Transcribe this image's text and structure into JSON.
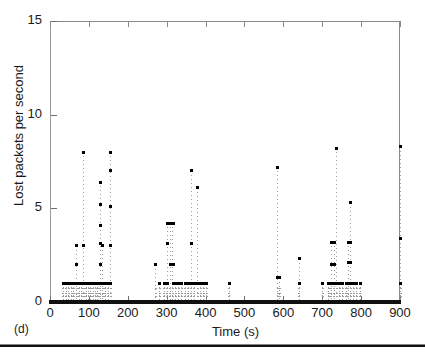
{
  "figure": {
    "subfigure_label": "(d)"
  },
  "chart_data": {
    "type": "scatter",
    "title": "",
    "xlabel": "Time (s)",
    "ylabel": "Lost packets per second",
    "xlim": [
      0,
      900
    ],
    "ylim": [
      0,
      15
    ],
    "xticks": [
      0,
      100,
      200,
      300,
      400,
      500,
      600,
      700,
      800,
      900
    ],
    "yticks": [
      0,
      5,
      10,
      15
    ],
    "xtick_labels": [
      "0",
      "100",
      "200",
      "300",
      "400",
      "500",
      "600",
      "700",
      "800",
      "900"
    ],
    "ytick_labels": [
      "0",
      "5",
      "10",
      "15"
    ],
    "grid": false,
    "legend": null,
    "marker": "square-dot",
    "marker_color": "#000000",
    "stem_color": "#9c9c9c",
    "points": [
      {
        "x": 33,
        "y": 1
      },
      {
        "x": 40,
        "y": 1
      },
      {
        "x": 47,
        "y": 1
      },
      {
        "x": 54,
        "y": 1
      },
      {
        "x": 60,
        "y": 1
      },
      {
        "x": 67,
        "y": 1
      },
      {
        "x": 67,
        "y": 2
      },
      {
        "x": 67,
        "y": 3
      },
      {
        "x": 74,
        "y": 1
      },
      {
        "x": 80,
        "y": 1
      },
      {
        "x": 86,
        "y": 8
      },
      {
        "x": 86,
        "y": 3
      },
      {
        "x": 86,
        "y": 1
      },
      {
        "x": 92,
        "y": 1
      },
      {
        "x": 98,
        "y": 1
      },
      {
        "x": 104,
        "y": 1
      },
      {
        "x": 110,
        "y": 1
      },
      {
        "x": 116,
        "y": 1
      },
      {
        "x": 122,
        "y": 1
      },
      {
        "x": 128,
        "y": 6.4
      },
      {
        "x": 128,
        "y": 5.2
      },
      {
        "x": 128,
        "y": 4.1
      },
      {
        "x": 128,
        "y": 3.1
      },
      {
        "x": 128,
        "y": 2
      },
      {
        "x": 128,
        "y": 1
      },
      {
        "x": 134,
        "y": 3
      },
      {
        "x": 134,
        "y": 1
      },
      {
        "x": 141,
        "y": 1
      },
      {
        "x": 148,
        "y": 1
      },
      {
        "x": 155,
        "y": 8
      },
      {
        "x": 155,
        "y": 7
      },
      {
        "x": 155,
        "y": 5.1
      },
      {
        "x": 155,
        "y": 3
      },
      {
        "x": 155,
        "y": 1
      },
      {
        "x": 271,
        "y": 2
      },
      {
        "x": 281,
        "y": 1
      },
      {
        "x": 292,
        "y": 1
      },
      {
        "x": 300,
        "y": 4.2
      },
      {
        "x": 300,
        "y": 3.1
      },
      {
        "x": 300,
        "y": 1
      },
      {
        "x": 308,
        "y": 4.2
      },
      {
        "x": 308,
        "y": 2
      },
      {
        "x": 315,
        "y": 4.2
      },
      {
        "x": 315,
        "y": 2
      },
      {
        "x": 315,
        "y": 1
      },
      {
        "x": 322,
        "y": 1
      },
      {
        "x": 330,
        "y": 1
      },
      {
        "x": 338,
        "y": 1
      },
      {
        "x": 346,
        "y": 1
      },
      {
        "x": 354,
        "y": 1
      },
      {
        "x": 362,
        "y": 7
      },
      {
        "x": 362,
        "y": 3.1
      },
      {
        "x": 362,
        "y": 1
      },
      {
        "x": 370,
        "y": 1
      },
      {
        "x": 378,
        "y": 6.1
      },
      {
        "x": 378,
        "y": 1
      },
      {
        "x": 386,
        "y": 1
      },
      {
        "x": 394,
        "y": 1
      },
      {
        "x": 402,
        "y": 1
      },
      {
        "x": 460,
        "y": 1
      },
      {
        "x": 584,
        "y": 7.2
      },
      {
        "x": 584,
        "y": 1.3
      },
      {
        "x": 590,
        "y": 1.3
      },
      {
        "x": 640,
        "y": 2.3
      },
      {
        "x": 640,
        "y": 1
      },
      {
        "x": 700,
        "y": 1
      },
      {
        "x": 716,
        "y": 1
      },
      {
        "x": 722,
        "y": 3.2
      },
      {
        "x": 722,
        "y": 2
      },
      {
        "x": 722,
        "y": 1
      },
      {
        "x": 729,
        "y": 3.2
      },
      {
        "x": 729,
        "y": 2
      },
      {
        "x": 729,
        "y": 1
      },
      {
        "x": 736,
        "y": 8.2
      },
      {
        "x": 736,
        "y": 1
      },
      {
        "x": 744,
        "y": 1
      },
      {
        "x": 752,
        "y": 1
      },
      {
        "x": 760,
        "y": 1
      },
      {
        "x": 766,
        "y": 3.2
      },
      {
        "x": 766,
        "y": 2.1
      },
      {
        "x": 766,
        "y": 1
      },
      {
        "x": 772,
        "y": 5.3
      },
      {
        "x": 772,
        "y": 3.2
      },
      {
        "x": 772,
        "y": 2.1
      },
      {
        "x": 772,
        "y": 1
      },
      {
        "x": 780,
        "y": 1
      },
      {
        "x": 788,
        "y": 1
      },
      {
        "x": 796,
        "y": 1
      },
      {
        "x": 900,
        "y": 8.3
      },
      {
        "x": 900,
        "y": 3.4
      },
      {
        "x": 900,
        "y": 1
      }
    ],
    "dense_stems": [
      {
        "x": 33,
        "top": 1
      },
      {
        "x": 40,
        "top": 1
      },
      {
        "x": 47,
        "top": 1
      },
      {
        "x": 54,
        "top": 1
      },
      {
        "x": 60,
        "top": 1
      },
      {
        "x": 67,
        "top": 3
      },
      {
        "x": 74,
        "top": 1
      },
      {
        "x": 80,
        "top": 1
      },
      {
        "x": 86,
        "top": 8
      },
      {
        "x": 92,
        "top": 1
      },
      {
        "x": 98,
        "top": 1
      },
      {
        "x": 104,
        "top": 1
      },
      {
        "x": 110,
        "top": 1
      },
      {
        "x": 116,
        "top": 1
      },
      {
        "x": 122,
        "top": 1
      },
      {
        "x": 128,
        "top": 6.4
      },
      {
        "x": 134,
        "top": 3
      },
      {
        "x": 141,
        "top": 1
      },
      {
        "x": 148,
        "top": 1
      },
      {
        "x": 155,
        "top": 8
      },
      {
        "x": 271,
        "top": 2
      },
      {
        "x": 281,
        "top": 1
      },
      {
        "x": 292,
        "top": 1
      },
      {
        "x": 300,
        "top": 4.2
      },
      {
        "x": 308,
        "top": 4.2
      },
      {
        "x": 315,
        "top": 4.2
      },
      {
        "x": 322,
        "top": 1
      },
      {
        "x": 330,
        "top": 1
      },
      {
        "x": 338,
        "top": 1
      },
      {
        "x": 346,
        "top": 1
      },
      {
        "x": 354,
        "top": 1
      },
      {
        "x": 362,
        "top": 7
      },
      {
        "x": 370,
        "top": 1
      },
      {
        "x": 378,
        "top": 6.1
      },
      {
        "x": 386,
        "top": 1
      },
      {
        "x": 394,
        "top": 1
      },
      {
        "x": 402,
        "top": 1
      },
      {
        "x": 460,
        "top": 1
      },
      {
        "x": 584,
        "top": 7.2
      },
      {
        "x": 590,
        "top": 1.3
      },
      {
        "x": 640,
        "top": 2.3
      },
      {
        "x": 700,
        "top": 1
      },
      {
        "x": 716,
        "top": 1
      },
      {
        "x": 722,
        "top": 3.2
      },
      {
        "x": 729,
        "top": 3.2
      },
      {
        "x": 736,
        "top": 8.2
      },
      {
        "x": 744,
        "top": 1
      },
      {
        "x": 752,
        "top": 1
      },
      {
        "x": 760,
        "top": 1
      },
      {
        "x": 766,
        "top": 3.2
      },
      {
        "x": 772,
        "top": 5.3
      },
      {
        "x": 780,
        "top": 1
      },
      {
        "x": 788,
        "top": 1
      },
      {
        "x": 796,
        "top": 1
      },
      {
        "x": 900,
        "top": 8.3
      }
    ]
  }
}
